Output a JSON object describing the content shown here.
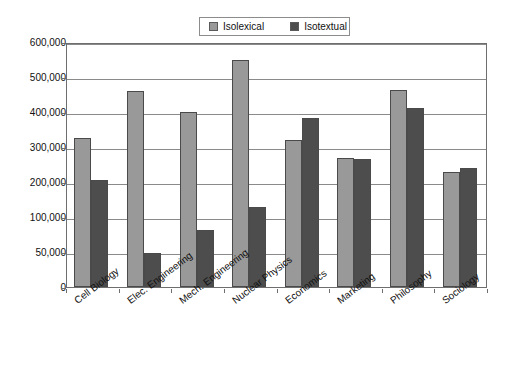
{
  "chart_data": {
    "type": "bar",
    "title": "",
    "xlabel": "",
    "ylabel": "",
    "grid": true,
    "legend_position": "top-center",
    "categories": [
      "Cell Biology",
      "Elec. Engineering",
      "Mech. Engineering",
      "Nuclear Physics",
      "Economics",
      "Marketing",
      "Philosophy",
      "Sociology"
    ],
    "series": [
      {
        "name": "Isolexical",
        "color": "#999999",
        "values": [
          325000,
          460000,
          400000,
          548000,
          320000,
          268000,
          463000,
          228000
        ]
      },
      {
        "name": "Isotextual",
        "color": "#4d4d4d",
        "values": [
          205000,
          48000,
          82000,
          128000,
          383000,
          265000,
          412000,
          240000
        ]
      }
    ],
    "ytick_labels": [
      "0",
      "50,000",
      "100,000",
      "200,000",
      "300,000",
      "400,000",
      "500,000",
      "600,000"
    ],
    "ytick_values": [
      0,
      50000,
      100000,
      200000,
      300000,
      400000,
      500000,
      600000
    ],
    "ylim": [
      0,
      600000
    ],
    "axis_note": "gridlines equally spaced"
  },
  "legend": {
    "items": [
      {
        "label": "Isolexical",
        "swatch": "light"
      },
      {
        "label": "Isotextual",
        "swatch": "dark"
      }
    ]
  }
}
